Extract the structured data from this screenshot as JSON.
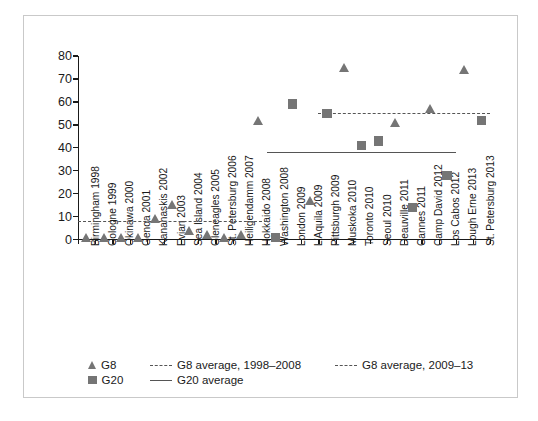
{
  "chart_data": {
    "type": "scatter",
    "title": "",
    "xlabel": "",
    "ylabel": "",
    "ylim": [
      0,
      80
    ],
    "yticks": [
      0,
      10,
      20,
      30,
      40,
      50,
      60,
      70,
      80
    ],
    "grid": false,
    "legend_position": "bottom-left",
    "categories": [
      "Birmingham 1998",
      "Cologne 1999",
      "Okinawa 2000",
      "Genoa 2001",
      "Kananaskis 2002",
      "Evian 2003",
      "Sea Island 2004",
      "Gleneagles 2005",
      "St. Petersburg 2006",
      "Heiligendamm 2007",
      "Hokkaido 2008",
      "Washington 2008",
      "London 2009",
      "L'Aquila 2009",
      "Pittsburgh 2009",
      "Muskoka 2010",
      "Toronto 2010",
      "Seoul 2010",
      "Deauville 2011",
      "Cannes 2011",
      "Camp David 2012",
      "Los Cabos 2012",
      "Lough Erne 2013",
      "St. Petersburg 2013"
    ],
    "series": [
      {
        "name": "G8",
        "marker": "triangle",
        "color": "#757575",
        "points": [
          {
            "category": "Birmingham 1998",
            "value": 1
          },
          {
            "category": "Cologne 1999",
            "value": 1
          },
          {
            "category": "Okinawa 2000",
            "value": 1
          },
          {
            "category": "Genoa 2001",
            "value": 1
          },
          {
            "category": "Kananaskis 2002",
            "value": 9
          },
          {
            "category": "Evian 2003",
            "value": 15
          },
          {
            "category": "Sea Island 2004",
            "value": 4
          },
          {
            "category": "Gleneagles 2005",
            "value": 2
          },
          {
            "category": "St. Petersburg 2006",
            "value": 1
          },
          {
            "category": "Heiligendamm 2007",
            "value": 2
          },
          {
            "category": "Hokkaido 2008",
            "value": 52
          },
          {
            "category": "L'Aquila 2009",
            "value": 17
          },
          {
            "category": "Muskoka 2010",
            "value": 75
          },
          {
            "category": "Deauville 2011",
            "value": 51
          },
          {
            "category": "Camp David 2012",
            "value": 57
          },
          {
            "category": "Lough Erne 2013",
            "value": 74
          }
        ]
      },
      {
        "name": "G20",
        "marker": "square",
        "color": "#757575",
        "points": [
          {
            "category": "Washington 2008",
            "value": 1
          },
          {
            "category": "London 2009",
            "value": 59
          },
          {
            "category": "Pittsburgh 2009",
            "value": 55
          },
          {
            "category": "Toronto 2010",
            "value": 41
          },
          {
            "category": "Seoul 2010",
            "value": 43
          },
          {
            "category": "Cannes 2011",
            "value": 14
          },
          {
            "category": "Los Cabos 2012",
            "value": 28
          },
          {
            "category": "St. Petersburg 2013",
            "value": 52
          }
        ]
      }
    ],
    "reference_lines": [
      {
        "name": "G8 average, 1998-2008",
        "value": 8,
        "style": "dashed",
        "from_category": "Birmingham 1998",
        "to_category": "Hokkaido 2008"
      },
      {
        "name": "G8 average, 2009-13",
        "value": 55,
        "style": "dashed",
        "from_category": "Pittsburgh 2009",
        "to_category": "St. Petersburg 2013"
      },
      {
        "name": "G20 average",
        "value": 38,
        "style": "solid",
        "from_category": "Washington 2008",
        "to_category": "Los Cabos 2012"
      }
    ]
  },
  "legend": {
    "items": [
      {
        "label": "G8",
        "marker": "triangle"
      },
      {
        "label": "G20",
        "marker": "square"
      },
      {
        "label": "G8 average, 1998–2008",
        "marker": "dashed-line"
      },
      {
        "label": "G8 average, 2009–13",
        "marker": "dashed-line"
      },
      {
        "label": "G20 average",
        "marker": "solid-line"
      }
    ]
  },
  "colors": {
    "marker": "#757575",
    "line": "#555555",
    "axis": "#1a1a1a",
    "frame": "#c9c9c9",
    "background": "#ffffff"
  }
}
